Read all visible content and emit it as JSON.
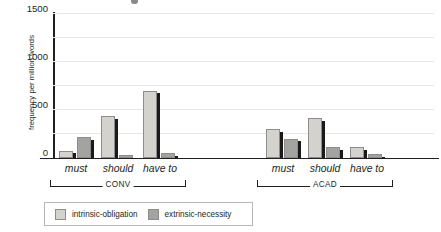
{
  "chart_data": {
    "type": "bar",
    "title": "",
    "xlabel": "",
    "ylabel": "frequency per million words",
    "ylim": [
      0,
      3000
    ],
    "yticks": [
      0,
      500,
      1000,
      1500,
      2000,
      2500,
      3000
    ],
    "ytick_labels": [
      "0",
      "500",
      "1000",
      "1500",
      "2000",
      "2500",
      "3000"
    ],
    "grid": true,
    "legend_position": "bottom-left",
    "categories": [
      "must",
      "should",
      "have to",
      "must",
      "should",
      "have to"
    ],
    "groups": [
      {
        "name": "CONV",
        "categories": [
          "must",
          "should",
          "have to"
        ]
      },
      {
        "name": "ACAD",
        "categories": [
          "must",
          "should",
          "have to"
        ]
      }
    ],
    "series": [
      {
        "name": "intrinsic-obligation",
        "color": "#d4d2cd",
        "values": [
          150,
          870,
          1400,
          600,
          830,
          230
        ]
      },
      {
        "name": "extrinsic-necessity",
        "color": "#a3a3a0",
        "values": [
          430,
          60,
          100,
          400,
          230,
          80
        ]
      }
    ]
  },
  "axis": {
    "y_title": "frequency per million words"
  },
  "legend": {
    "entries": [
      {
        "label": "intrinsic-obligation",
        "series": 0
      },
      {
        "label": "extrinsic-necessity",
        "series": 1
      }
    ]
  }
}
